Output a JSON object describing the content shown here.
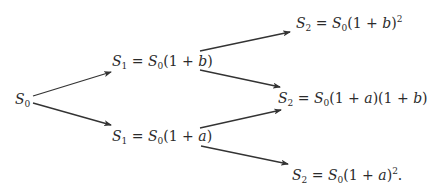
{
  "diagram": {
    "type": "binomial-tree",
    "nodes": {
      "s0": {
        "label": "S0",
        "text": "S_0"
      },
      "s1_up": {
        "label": "S1 = S0(1 + b)",
        "text": "S_1 = S_0(1+b)"
      },
      "s1_down": {
        "label": "S1 = S0(1 + a)",
        "text": "S_1 = S_0(1+a)"
      },
      "s2_uu": {
        "label": "S2 = S0(1 + b)^2",
        "text": "S_2 = S_0(1+b)^2"
      },
      "s2_ud": {
        "label": "S2 = S0(1 + a)(1 + b)",
        "text": "S_2 = S_0(1+a)(1+b)"
      },
      "s2_dd": {
        "label": "S2 = S0(1 + a)^2.",
        "text": "S_2 = S_0(1+a)^2."
      }
    },
    "edges": [
      {
        "from": "s0",
        "to": "s1_up"
      },
      {
        "from": "s0",
        "to": "s1_down"
      },
      {
        "from": "s1_up",
        "to": "s2_uu"
      },
      {
        "from": "s1_up",
        "to": "s2_ud"
      },
      {
        "from": "s1_down",
        "to": "s2_ud"
      },
      {
        "from": "s1_down",
        "to": "s2_dd"
      }
    ],
    "colors": {
      "line": "#333333",
      "text": "#2b2b2b",
      "background": "#ffffff"
    }
  }
}
